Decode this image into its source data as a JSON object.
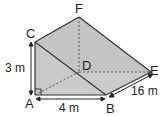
{
  "diagram": {
    "type": "triangular-prism",
    "vertices": {
      "A": {
        "label": "A",
        "x": 35,
        "y": 95
      },
      "B": {
        "label": "B",
        "x": 106,
        "y": 95
      },
      "C": {
        "label": "C",
        "x": 35,
        "y": 42
      },
      "D": {
        "label": "D",
        "x": 79,
        "y": 72
      },
      "E": {
        "label": "E",
        "x": 151,
        "y": 72
      },
      "F": {
        "label": "F",
        "x": 79,
        "y": 17
      }
    },
    "measurements": {
      "height_AC": "3 m",
      "base_AB": "4 m",
      "length_BE": "16 m"
    },
    "right_angle_at": "A",
    "colors": {
      "face_fill": "#c8c8c8",
      "edge": "#333333",
      "hidden_edge": "#555555"
    }
  }
}
